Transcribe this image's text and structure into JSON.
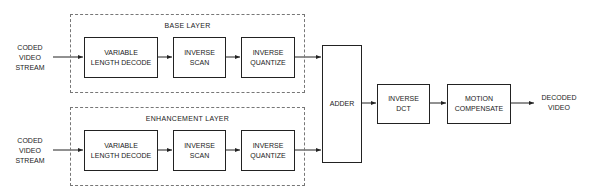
{
  "diagram": {
    "base_layer": {
      "title": "BASE LAYER",
      "input_label": "CODED\nVIDEO\nSTREAM",
      "blocks": [
        "VARIABLE\nLENGTH DECODE",
        "INVERSE\nSCAN",
        "INVERSE\nQUANTIZE"
      ]
    },
    "enhancement_layer": {
      "title": "ENHANCEMENT LAYER",
      "input_label": "CODED\nVIDEO\nSTREAM",
      "blocks": [
        "VARIABLE\nLENGTH DECODE",
        "INVERSE\nSCAN",
        "INVERSE\nQUANTIZE"
      ]
    },
    "adder": "ADDER",
    "inverse_dct": "INVERSE\nDCT",
    "motion_compensate": "MOTION\nCOMPENSATE",
    "output_label": "DECODED\nVIDEO"
  }
}
